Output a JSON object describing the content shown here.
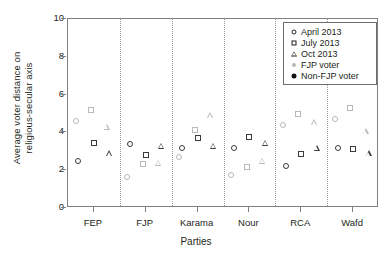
{
  "chart_data": {
    "type": "scatter",
    "title": "",
    "xlabel": "Parties",
    "ylabel": "Average voter distance on religious-secular axis",
    "ylabel_line1": "Average voter distance on",
    "ylabel_line2": "religious-secular axis",
    "ylim": [
      0,
      10
    ],
    "yticks": [
      0,
      2,
      4,
      6,
      8,
      10
    ],
    "ytick_labels": [
      "0",
      "2",
      "4",
      "6",
      "8",
      "10"
    ],
    "grid": false,
    "group_separators": true,
    "categories": [
      "FEP",
      "FJP",
      "Karama",
      "Nour",
      "RCA",
      "Wafd"
    ],
    "legend_position": "top-right",
    "legend": [
      {
        "label": "April 2013",
        "marker": "circle"
      },
      {
        "label": "July 2013",
        "marker": "square"
      },
      {
        "label": "Oct 2013",
        "marker": "triangle"
      },
      {
        "label": "FJP voter",
        "marker": "filled-circle",
        "color": "#b9b9b9"
      },
      {
        "label": "Non-FJP voter",
        "marker": "filled-circle",
        "color": "#111111"
      }
    ],
    "series": [
      {
        "name": "April 2013 - FJP voter",
        "wave": "April 2013",
        "marker": "circle",
        "voter": "FJP voter",
        "color": "#b9b9b9",
        "values": [
          4.6,
          1.65,
          2.7,
          1.75,
          4.4,
          4.7
        ]
      },
      {
        "name": "April 2013 - Non-FJP voter",
        "wave": "April 2013",
        "marker": "circle",
        "voter": "Non-FJP voter",
        "color": "#3a3a3a",
        "values": [
          2.5,
          3.4,
          3.15,
          3.15,
          2.2,
          3.15
        ]
      },
      {
        "name": "July 2013 - FJP voter",
        "wave": "July 2013",
        "marker": "square",
        "voter": "FJP voter",
        "color": "#b9b9b9",
        "values": [
          5.2,
          2.35,
          4.15,
          2.15,
          5.0,
          5.3
        ]
      },
      {
        "name": "July 2013 - Non-FJP voter",
        "wave": "July 2013",
        "marker": "square",
        "voter": "Non-FJP voter",
        "color": "#3a3a3a",
        "values": [
          3.45,
          2.8,
          3.7,
          3.75,
          2.85,
          3.1
        ]
      },
      {
        "name": "Oct 2013 - FJP voter",
        "wave": "Oct 2013",
        "marker": "triangle",
        "voter": "FJP voter",
        "color": "#b9b9b9",
        "values": [
          4.3,
          2.4,
          4.9,
          2.5,
          4.55,
          4.05
        ]
      },
      {
        "name": "Oct 2013 - Non-FJP voter",
        "wave": "Oct 2013",
        "marker": "triangle",
        "voter": "Non-FJP voter",
        "color": "#3a3a3a",
        "values": [
          2.9,
          3.3,
          3.3,
          3.45,
          3.2,
          2.9
        ]
      }
    ]
  }
}
